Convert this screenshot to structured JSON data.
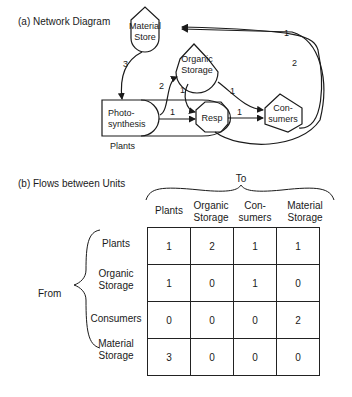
{
  "part_a": {
    "title": "(a) Network Diagram",
    "nodes": {
      "material_store": [
        "Material",
        "Store"
      ],
      "organic_storage": [
        "Organic",
        "Storage"
      ],
      "photosynthesis": [
        "Photo-",
        "synthesis"
      ],
      "resp": "Resp",
      "consumers": [
        "Con-",
        "sumers"
      ],
      "plants_label": "Plants"
    },
    "edges": {
      "store_to_photo": "3",
      "photo_to_organic": "2",
      "organic_to_resp": "1",
      "organic_to_consumers": "1",
      "photo_to_resp": "1",
      "resp_to_consumers": "1",
      "consumers_to_store_outer": "1",
      "consumers_to_store_inner": "2"
    }
  },
  "part_b": {
    "title": "(b) Flows between Units",
    "to_label": "To",
    "from_label": "From",
    "columns": [
      [
        "Plants"
      ],
      [
        "Organic",
        "Storage"
      ],
      [
        "Con-",
        "sumers"
      ],
      [
        "Material",
        "Storage"
      ]
    ],
    "rows": [
      {
        "label": [
          "Plants"
        ],
        "values": [
          "1",
          "2",
          "1",
          "1"
        ]
      },
      {
        "label": [
          "Organic",
          "Storage"
        ],
        "values": [
          "1",
          "0",
          "1",
          "0"
        ]
      },
      {
        "label": [
          "Consumers"
        ],
        "values": [
          "0",
          "0",
          "0",
          "2"
        ]
      },
      {
        "label": [
          "Material",
          "Storage"
        ],
        "values": [
          "3",
          "0",
          "0",
          "0"
        ]
      }
    ]
  }
}
